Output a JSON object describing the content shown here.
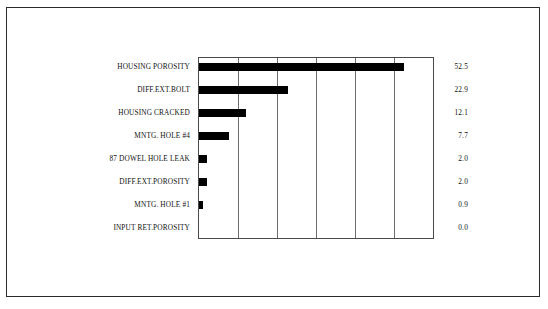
{
  "chart_data": {
    "type": "bar",
    "orientation": "horizontal",
    "title": "",
    "subtitle": "",
    "xlabel": "",
    "ylabel": "",
    "categories": [
      "HOUSING POROSITY",
      "DIFF.EXT.BOLT",
      "HOUSING CRACKED",
      "MNTG. HOLE #4",
      "87 DOWEL HOLE LEAK",
      "DIFF.EXT.POROSITY",
      "MNTG. HOLE #1",
      "INPUT RET.POROSITY"
    ],
    "values": [
      52.5,
      22.9,
      12.1,
      7.7,
      2.0,
      2.0,
      0.9,
      0.0
    ],
    "value_labels": [
      "52.5",
      "22.9",
      "12.1",
      "7.7",
      "2.0",
      "2.0",
      "0.9",
      "0.0"
    ],
    "xlim": [
      0,
      60
    ],
    "gridline_values": [
      10,
      20,
      30,
      40,
      50
    ],
    "grid": true,
    "legend": "none",
    "bar_color": "#000000",
    "axis_color": "#4a4a4a",
    "grid_color": "#6e6e6e",
    "background_color": "#ffffff",
    "tick_labels": []
  }
}
